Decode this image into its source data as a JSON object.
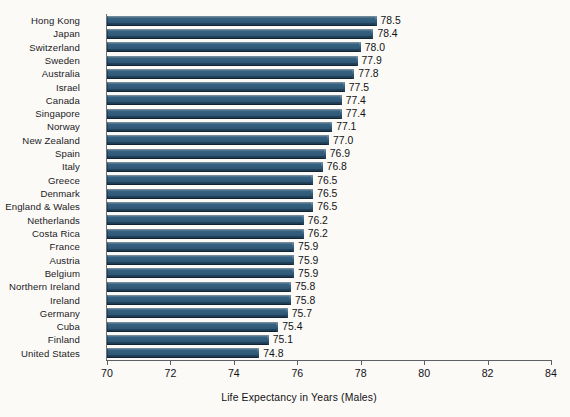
{
  "chart_data": {
    "type": "bar",
    "orientation": "horizontal",
    "title": "",
    "xlabel": "Life Expectancy in Years (Males)",
    "ylabel": "",
    "xlim": [
      70,
      84
    ],
    "xticks": [
      70,
      72,
      74,
      76,
      78,
      80,
      82,
      84
    ],
    "grid": false,
    "legend": null,
    "value_label_format": "one-decimal",
    "bar_color": "#2d5776",
    "background_color": "#fbfaf7",
    "categories": [
      "Hong Kong",
      "Japan",
      "Switzerland",
      "Sweden",
      "Australia",
      "Israel",
      "Canada",
      "Singapore",
      "Norway",
      "New Zealand",
      "Spain",
      "Italy",
      "Greece",
      "Denmark",
      "England & Wales",
      "Netherlands",
      "Costa Rica",
      "France",
      "Austria",
      "Belgium",
      "Northern Ireland",
      "Ireland",
      "Germany",
      "Cuba",
      "Finland",
      "United States"
    ],
    "values": [
      78.5,
      78.4,
      78.0,
      77.9,
      77.8,
      77.5,
      77.4,
      77.4,
      77.1,
      77.0,
      76.9,
      76.8,
      76.5,
      76.5,
      76.5,
      76.2,
      76.2,
      75.9,
      75.9,
      75.9,
      75.8,
      75.8,
      75.7,
      75.4,
      75.1,
      74.8
    ],
    "value_labels": [
      "78.5",
      "78.4",
      "78.0",
      "77.9",
      "77.8",
      "77.5",
      "77.4",
      "77.4",
      "77.1",
      "77.0",
      "76.9",
      "76.8",
      "76.5",
      "76.5",
      "76.5",
      "76.2",
      "76.2",
      "75.9",
      "75.9",
      "75.9",
      "75.8",
      "75.8",
      "75.7",
      "75.4",
      "75.1",
      "74.8"
    ],
    "xtick_labels": [
      "70",
      "72",
      "74",
      "76",
      "78",
      "80",
      "82",
      "84"
    ]
  }
}
